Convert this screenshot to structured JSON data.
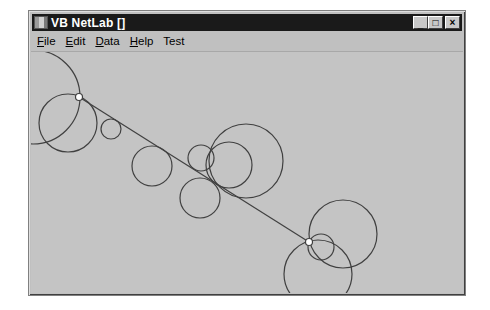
{
  "window": {
    "title": "VB NetLab []",
    "icon": "app-icon",
    "controls": {
      "minimize": "_",
      "maximize": "□",
      "close": "×"
    }
  },
  "menubar": {
    "items": [
      {
        "label": "File",
        "access_key": "F"
      },
      {
        "label": "Edit",
        "access_key": "E"
      },
      {
        "label": "Data",
        "access_key": "D"
      },
      {
        "label": "Help",
        "access_key": "H"
      },
      {
        "label": "Test",
        "access_key": ""
      }
    ]
  },
  "canvas": {
    "stroke_color": "#404040",
    "node_fill": "#ffffff",
    "link": {
      "from": [
        79,
        96
      ],
      "to": [
        309,
        241
      ]
    },
    "nodes": [
      {
        "id": 1,
        "x": 79,
        "y": 96
      },
      {
        "id": 2,
        "x": 309,
        "y": 241
      }
    ],
    "circles": [
      {
        "cx": 33,
        "cy": 96,
        "r": 47
      },
      {
        "cx": 68,
        "cy": 122,
        "r": 29
      },
      {
        "cx": 111,
        "cy": 128,
        "r": 10
      },
      {
        "cx": 152,
        "cy": 165,
        "r": 20
      },
      {
        "cx": 201,
        "cy": 157,
        "r": 13
      },
      {
        "cx": 229,
        "cy": 164,
        "r": 23
      },
      {
        "cx": 246,
        "cy": 160,
        "r": 37
      },
      {
        "cx": 200,
        "cy": 197,
        "r": 20
      },
      {
        "cx": 343,
        "cy": 233,
        "r": 34
      },
      {
        "cx": 321,
        "cy": 246,
        "r": 13
      },
      {
        "cx": 318,
        "cy": 273,
        "r": 34
      }
    ]
  }
}
